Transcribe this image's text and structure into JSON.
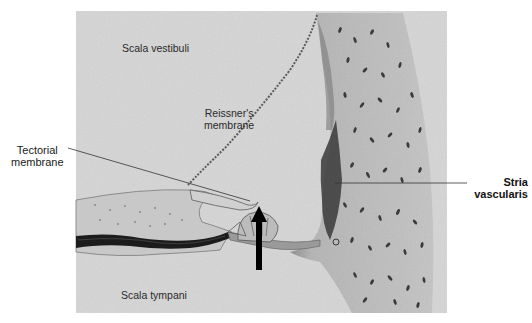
{
  "figure": {
    "type": "histological illustration",
    "background_color": "#d9d9d9",
    "tissue_color": "#bdbdbd",
    "dark_stain_color": "#1c1c1c"
  },
  "labels": {
    "scala_vestibuli": "Scala vestibuli",
    "reissners_line1": "Reissner's",
    "reissners_line2": "membrane",
    "tectorial_line1": "Tectorial",
    "tectorial_line2": "membrane",
    "stria_line1": "Stria",
    "stria_line2": "vascularis",
    "scala_tympani": "Scala tympani"
  },
  "annotations": {
    "arrow": {
      "direction": "up",
      "target": "organ of Corti",
      "color": "#000000"
    }
  }
}
